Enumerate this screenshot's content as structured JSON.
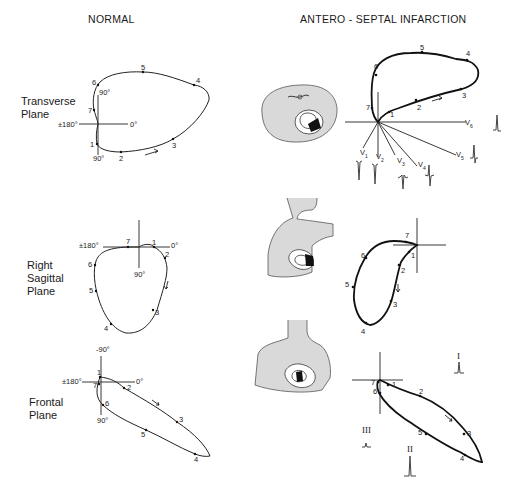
{
  "figure": {
    "columns": {
      "normal": "NORMAL",
      "infarction": "ANTERO - SEPTAL INFARCTION"
    },
    "planes": [
      {
        "name": "Transverse\nPlane",
        "axis_labels": {
          "left": "±180°",
          "right": "0°",
          "top": "90°",
          "bottom": "90°"
        },
        "normal_points": [
          "1",
          "2",
          "3",
          "4",
          "5",
          "6",
          "7"
        ],
        "infarction_points": [
          "1",
          "2",
          "3",
          "4",
          "5",
          "6",
          "7"
        ],
        "leads": [
          "V1",
          "V2",
          "V3",
          "V4",
          "V5",
          "V6"
        ]
      },
      {
        "name": "Right\nSagittal\nPlane",
        "axis_labels": {
          "left": "±180°",
          "right": "0°",
          "top": "-90°",
          "bottom": "90°"
        },
        "normal_points": [
          "1",
          "2",
          "3",
          "4",
          "5",
          "6",
          "7"
        ],
        "infarction_points": [
          "1",
          "2",
          "3",
          "4",
          "5",
          "6",
          "7"
        ]
      },
      {
        "name": "Frontal\nPlane",
        "axis_labels": {
          "left": "±180°",
          "right": "0°",
          "top": "-90°",
          "bottom": "90°"
        },
        "normal_points": [
          "1",
          "2",
          "3",
          "4",
          "5",
          "6",
          "7"
        ],
        "infarction_points": [
          "1",
          "2",
          "3",
          "4",
          "5",
          "6",
          "7"
        ],
        "leads": [
          "I",
          "II",
          "III"
        ]
      }
    ],
    "lead_labels": {
      "v1": "V",
      "v1_sub": "1",
      "v2": "V",
      "v2_sub": "2",
      "v3": "V",
      "v3_sub": "3",
      "v4": "V",
      "v4_sub": "4",
      "v5": "V",
      "v5_sub": "5",
      "v6": "V",
      "v6_sub": "6",
      "lead_I": "I",
      "lead_II": "II",
      "lead_III": "III"
    }
  }
}
